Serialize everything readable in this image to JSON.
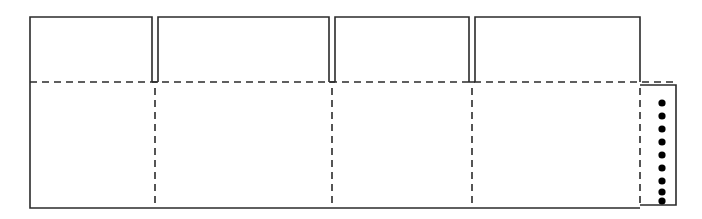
{
  "drawing": {
    "title": "Carton Dieline Flat Pattern",
    "type": "packaging-dieline",
    "canvas": {
      "width": 702,
      "height": 219,
      "background": "#ffffff"
    },
    "style": {
      "cut_color": "#2b2b2b",
      "cut_width": 1.6,
      "fold_color": "#2b2b2b",
      "fold_width": 1.6,
      "fold_dash": "7,5",
      "dot_color": "#000000"
    },
    "geometry": {
      "body": {
        "left": 30,
        "right": 640,
        "top": 82,
        "bottom": 208
      },
      "flap_top": 17,
      "slit_width": 6,
      "glue_flap": {
        "left": 640,
        "right": 676,
        "top": 85,
        "bottom": 205
      }
    },
    "top_panels": [
      {
        "name": "panel-1",
        "left": 30,
        "right": 152
      },
      {
        "name": "panel-2",
        "left": 158,
        "right": 329
      },
      {
        "name": "panel-3",
        "left": 335,
        "right": 469
      },
      {
        "name": "panel-4",
        "left": 475,
        "right": 640
      }
    ],
    "slits": [
      {
        "name": "slit-1",
        "x": 155
      },
      {
        "name": "slit-2",
        "x": 332
      },
      {
        "name": "slit-3",
        "x": 472
      }
    ],
    "fold_lines": {
      "horizontal": [
        {
          "name": "horizontal-fold",
          "y": 82,
          "x1": 30,
          "x2": 676
        }
      ],
      "vertical": [
        {
          "name": "vertical-fold-1",
          "x": 155,
          "y1": 88,
          "y2": 207
        },
        {
          "name": "vertical-fold-2",
          "x": 332,
          "y1": 88,
          "y2": 207
        },
        {
          "name": "vertical-fold-3",
          "x": 472,
          "y1": 88,
          "y2": 207
        },
        {
          "name": "vertical-fold-4",
          "x": 640,
          "y1": 88,
          "y2": 205
        }
      ]
    },
    "glue_dots": {
      "count": 9,
      "radius": 3.6,
      "x": 662,
      "ys": [
        103,
        116,
        129,
        142,
        155,
        168,
        181,
        192,
        201
      ]
    }
  }
}
